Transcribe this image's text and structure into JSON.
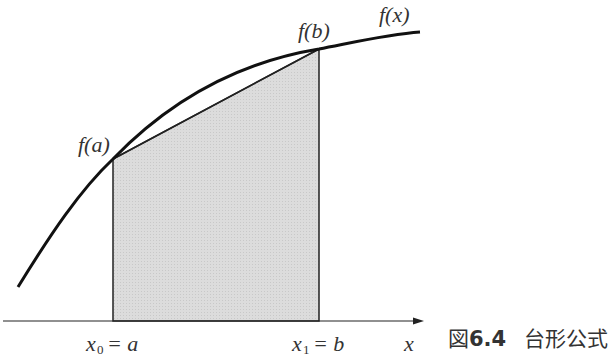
{
  "figure": {
    "caption_label": "図",
    "caption_number": "6.4",
    "caption_title": "台形公式"
  },
  "labels": {
    "curve": "f(x)",
    "fa": "f(a)",
    "fb": "f(b)",
    "x0_var": "x",
    "x0_sub": "0",
    "x0_rhs": "= a",
    "x1_var": "x",
    "x1_sub": "1",
    "x1_rhs": "= b",
    "axis": "x"
  },
  "colors": {
    "curve": "#111111",
    "fill": "#d9d9d9",
    "axis": "#222222"
  }
}
